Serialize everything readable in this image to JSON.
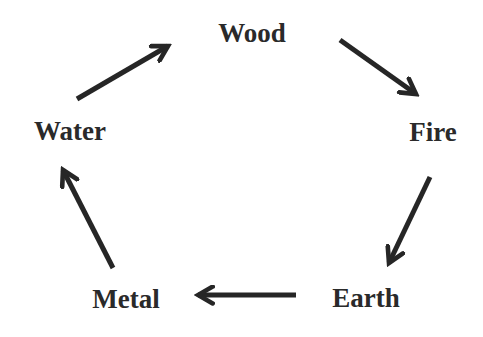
{
  "diagram": {
    "type": "cycle",
    "title": "",
    "colors": {
      "text": "#2a2a2a",
      "arrow": "#262626",
      "background": "#ffffff"
    },
    "nodes": [
      {
        "id": "wood",
        "label": "Wood",
        "x": 252,
        "y": 33
      },
      {
        "id": "fire",
        "label": "Fire",
        "x": 433,
        "y": 132
      },
      {
        "id": "earth",
        "label": "Earth",
        "x": 366,
        "y": 298
      },
      {
        "id": "metal",
        "label": "Metal",
        "x": 126,
        "y": 299
      },
      {
        "id": "water",
        "label": "Water",
        "x": 70,
        "y": 131
      }
    ],
    "edges": [
      {
        "from": "water",
        "to": "wood",
        "x1": 77,
        "y1": 99,
        "x2": 168,
        "y2": 46
      },
      {
        "from": "wood",
        "to": "fire",
        "x1": 340,
        "y1": 40,
        "x2": 416,
        "y2": 94
      },
      {
        "from": "fire",
        "to": "earth",
        "x1": 430,
        "y1": 177,
        "x2": 389,
        "y2": 263
      },
      {
        "from": "earth",
        "to": "metal",
        "x1": 296,
        "y1": 295,
        "x2": 198,
        "y2": 295
      },
      {
        "from": "metal",
        "to": "water",
        "x1": 113,
        "y1": 268,
        "x2": 63,
        "y2": 170
      }
    ]
  }
}
